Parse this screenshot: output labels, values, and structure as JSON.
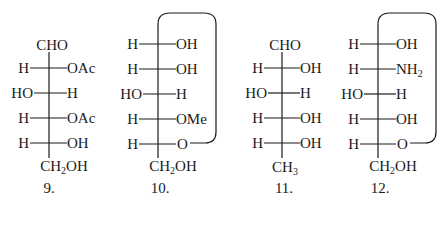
{
  "structures": [
    {
      "id": "9",
      "label": "9.",
      "top": "CHO",
      "rows": [
        {
          "left": "H",
          "right": "OAc"
        },
        {
          "left": "HO",
          "right": "H"
        },
        {
          "left": "H",
          "right": "OAc"
        },
        {
          "left": "H",
          "right": "OH"
        }
      ],
      "bottom": {
        "main": "CH",
        "sub": "2",
        "tail": "OH"
      },
      "ring": false
    },
    {
      "id": "10",
      "label": "10.",
      "rows": [
        {
          "left": "H",
          "right": "OH"
        },
        {
          "left": "H",
          "right": "OH"
        },
        {
          "left": "HO",
          "right": "H"
        },
        {
          "left": "H",
          "right": "OMe"
        },
        {
          "left": "H",
          "right": "O"
        }
      ],
      "bottom": {
        "main": "CH",
        "sub": "2",
        "tail": "OH"
      },
      "ring": true
    },
    {
      "id": "11",
      "label": "11.",
      "top": "CHO",
      "rows": [
        {
          "left": "H",
          "right": "OH"
        },
        {
          "left": "HO",
          "right": "H"
        },
        {
          "left": "H",
          "right": "OH"
        },
        {
          "left": "H",
          "right": "OH"
        }
      ],
      "bottom": {
        "main": "CH",
        "sub": "3",
        "tail": ""
      },
      "ring": false
    },
    {
      "id": "12",
      "label": "12.",
      "rows": [
        {
          "left": "H",
          "right": "OH"
        },
        {
          "left": "H",
          "right": "NH",
          "right_sub": "2"
        },
        {
          "left": "HO",
          "right": "H"
        },
        {
          "left": "H",
          "right": "OH"
        },
        {
          "left": "H",
          "right": "O"
        }
      ],
      "bottom": {
        "main": "CH",
        "sub": "2",
        "tail": "OH"
      },
      "ring": true
    }
  ],
  "colors": {
    "ink": "#1a1a1a",
    "background": "#ffffff"
  }
}
